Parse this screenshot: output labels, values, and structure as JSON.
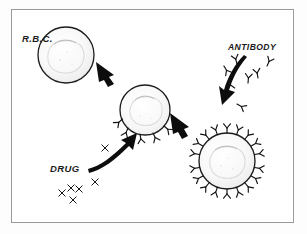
{
  "figure": {
    "medium": "scanned line drawing",
    "frame_color": "#9a9a9a",
    "ink_color": "#121212",
    "background_color": "#ffffff"
  },
  "labels": {
    "rbc": "R.B.C.",
    "drug": "DRUG",
    "antibody": "ANTIBODY"
  },
  "stages": [
    {
      "id": "stage-1",
      "name": "bare-red-blood-cell",
      "label": "R.B.C.",
      "cx": 66,
      "cy": 55,
      "r": 28,
      "drug_markers": 0,
      "antibody_markers": 0
    },
    {
      "id": "stage-2",
      "name": "drug-coated-red-blood-cell",
      "label": "",
      "cx": 145,
      "cy": 110,
      "r": 25,
      "drug_markers": 5,
      "antibody_markers": 0
    },
    {
      "id": "stage-3",
      "name": "antibody-coated-red-blood-cell",
      "label": "",
      "cx": 227,
      "cy": 161,
      "r": 28,
      "drug_markers": 0,
      "antibody_markers": 18
    }
  ],
  "arrows": [
    {
      "id": "arrow-1",
      "name": "arrow-stage1-to-stage2",
      "from": "stage-1",
      "to": "stage-2",
      "direction": "down-right"
    },
    {
      "id": "arrow-2",
      "name": "arrow-stage2-to-stage3",
      "from": "stage-2",
      "to": "stage-3",
      "direction": "down-right"
    },
    {
      "id": "arrow-3",
      "name": "arrow-drug-to-cell",
      "from": "drug",
      "to": "stage-2",
      "direction": "up-right"
    },
    {
      "id": "arrow-4",
      "name": "arrow-antibody-to-cell",
      "from": "antibody",
      "to": "stage-3",
      "direction": "down-left-curved"
    }
  ],
  "free_particles": {
    "drug_molecules": {
      "symbol": "x",
      "count": 6,
      "description": "free drug molecules drawn as small x marks"
    },
    "antibody_molecules": {
      "symbol": "Y",
      "count": 7,
      "description": "free antibodies drawn as small Y shapes"
    }
  }
}
